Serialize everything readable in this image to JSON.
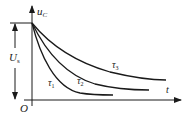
{
  "diagram": {
    "type": "rc-discharge-curves",
    "y_axis_label": "u",
    "y_axis_label_sub": "C",
    "x_axis_label": "t",
    "origin_label": "O",
    "level_label": "U",
    "level_label_sub": "s",
    "curves": [
      {
        "label": "τ",
        "label_sub": "1",
        "order": "fastest decay"
      },
      {
        "label": "τ",
        "label_sub": "2",
        "order": "medium decay"
      },
      {
        "label": "τ",
        "label_sub": "3",
        "order": "slowest decay"
      }
    ],
    "colors": {
      "ink": "#1a1a1a",
      "background": "#ffffff"
    }
  }
}
